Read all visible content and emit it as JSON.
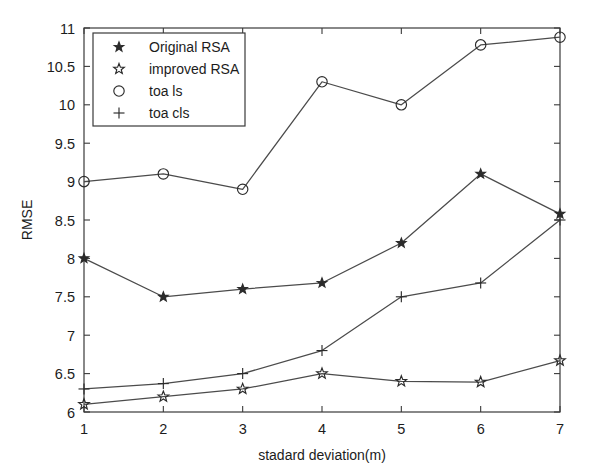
{
  "chart_data": {
    "type": "line",
    "title": "",
    "xlabel": "stadard deviation(m)",
    "ylabel": "RMSE",
    "x": [
      1,
      2,
      3,
      4,
      5,
      6,
      7
    ],
    "xlim": [
      1,
      7
    ],
    "ylim": [
      6,
      11
    ],
    "xticks": [
      "1",
      "2",
      "3",
      "4",
      "5",
      "6",
      "7"
    ],
    "yticks": [
      "6",
      "6.5",
      "7",
      "7.5",
      "8",
      "8.5",
      "9",
      "9.5",
      "10",
      "10.5",
      "11"
    ],
    "ytick_values": [
      6,
      6.5,
      7,
      7.5,
      8,
      8.5,
      9,
      9.5,
      10,
      10.5,
      11
    ],
    "grid": false,
    "legend_position": "upper-left",
    "series": [
      {
        "name": "Original RSA",
        "marker": "star-filled",
        "values": [
          8.0,
          7.5,
          7.6,
          7.68,
          8.2,
          9.1,
          8.58
        ]
      },
      {
        "name": "improved RSA",
        "marker": "star-open",
        "values": [
          6.1,
          6.2,
          6.3,
          6.5,
          6.4,
          6.39,
          6.67
        ]
      },
      {
        "name": "toa ls",
        "marker": "circle-open",
        "values": [
          9.0,
          9.1,
          8.9,
          10.3,
          10.0,
          10.78,
          10.88
        ]
      },
      {
        "name": "toa cls",
        "marker": "plus",
        "values": [
          6.3,
          6.37,
          6.5,
          6.8,
          7.5,
          7.68,
          8.5
        ]
      }
    ]
  },
  "legend": {
    "entries": [
      {
        "label": "Original RSA",
        "marker": "star-filled"
      },
      {
        "label": "improved RSA",
        "marker": "star-open"
      },
      {
        "label": "toa ls",
        "marker": "circle-open"
      },
      {
        "label": "toa cls",
        "marker": "plus"
      }
    ]
  },
  "axes": {
    "x_title": "stadard deviation(m)",
    "y_title": "RMSE"
  },
  "colors": {
    "line": "#4b4b4b",
    "axis": "#3a3a3a",
    "text": "#1c1c1c",
    "background": "#ffffff"
  }
}
